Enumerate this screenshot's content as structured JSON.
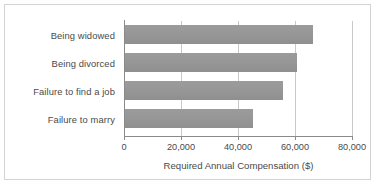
{
  "chart_data": {
    "type": "bar",
    "orientation": "horizontal",
    "title": "",
    "xlabel": "Required Annual Compensation ($)",
    "ylabel": "",
    "categories": [
      "Being widowed",
      "Being divorced",
      "Failure to find a job",
      "Failure to marry"
    ],
    "values": [
      66000,
      60500,
      55500,
      45000
    ],
    "xlim": [
      0,
      80000
    ],
    "xticks": [
      0,
      20000,
      40000,
      60000,
      80000
    ],
    "xtick_labels": [
      "0",
      "20,000",
      "40,000",
      "60,000",
      "80,000"
    ],
    "grid": "vertical",
    "legend": "none",
    "bar_color": "#979797",
    "axis_color": "#8a8a8a",
    "gridline_color": "#c9c9c9",
    "text_color": "#4a4a4a",
    "frame_color": "#d3d3d3",
    "background": "#ffffff"
  }
}
